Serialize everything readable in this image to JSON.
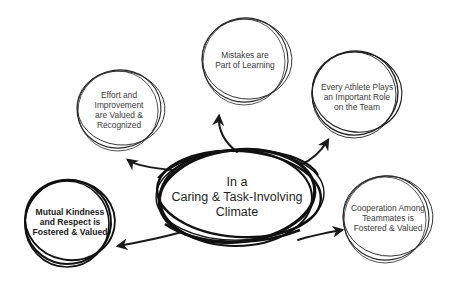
{
  "diagram": {
    "center": {
      "lines": [
        "In a",
        "Caring & Task-Involving",
        "Climate"
      ],
      "text": "In a\nCaring & Task-Involving\nClimate"
    },
    "nodes": [
      {
        "id": "effort",
        "text": "Effort and\nImprovement\nare Valued &\nRecognized"
      },
      {
        "id": "mistakes",
        "text": "Mistakes are\nPart of Learning"
      },
      {
        "id": "every-athlete",
        "text": "Every Athlete Plays\nan Important Role\non the Team"
      },
      {
        "id": "mutual-kindness",
        "text": "Mutual Kindness\nand Respect is\nFostered & Valued"
      },
      {
        "id": "cooperation",
        "text": "Cooperation Among\nTeammates is\nFostered & Valued"
      }
    ],
    "edges": [
      {
        "from": "center",
        "to": "effort"
      },
      {
        "from": "center",
        "to": "mistakes"
      },
      {
        "from": "center",
        "to": "every-athlete"
      },
      {
        "from": "center",
        "to": "mutual-kindness"
      },
      {
        "from": "center",
        "to": "cooperation"
      }
    ],
    "colors": {
      "ink": "#1a1a1a",
      "background": "#ffffff"
    }
  }
}
